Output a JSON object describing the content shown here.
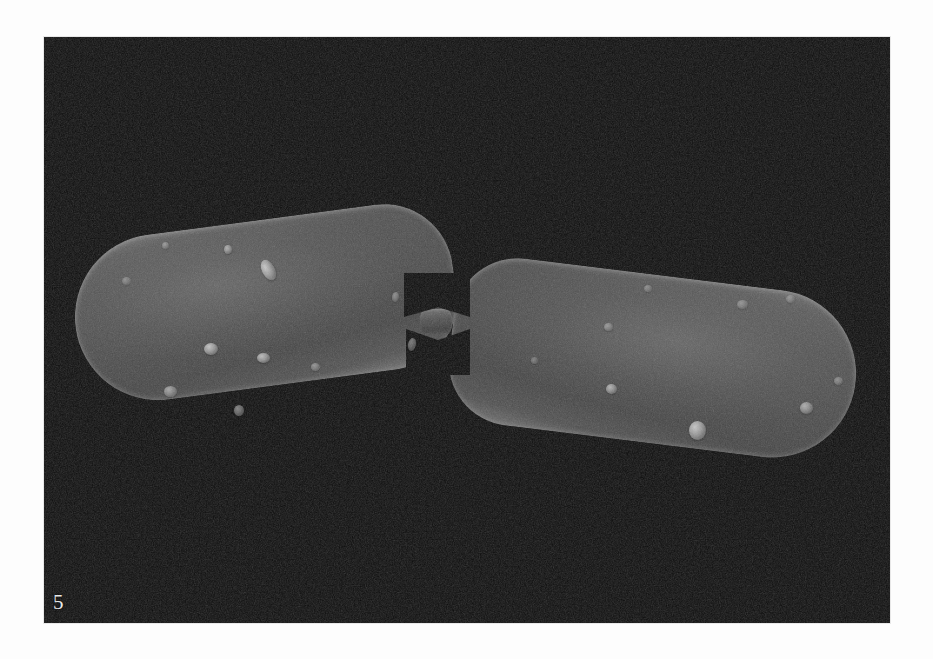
{
  "figure": {
    "plate_number": "5",
    "caption": "Scanning electron micrograph of a rod-shaped bacterium in the final stage of binary fission, the two daughter cells still joined by a narrow constricted septum.",
    "frame": {
      "left": 44,
      "top": 37,
      "width": 846,
      "height": 586
    }
  },
  "colors": {
    "page_background": "#fdfdfd",
    "micrograph_background": "#090909",
    "cell_body": "#4a4a4a",
    "cell_rim_highlight": "#7d7d7d",
    "bleb_highlight": "#cfcfcf",
    "label_text": "#e9e9e9"
  },
  "specimen": {
    "type": "bacillus",
    "state": "dividing",
    "cells": [
      {
        "id": "cell-left",
        "name": "left-daughter-cell",
        "x": 30,
        "y": 183,
        "width": 382,
        "height": 166,
        "rotation_deg": -7.5
      },
      {
        "id": "cell-right",
        "name": "right-daughter-cell",
        "x": 406,
        "y": 238,
        "width": 407,
        "height": 168,
        "rotation_deg": 7.0
      }
    ],
    "septum": {
      "name": "division-septum",
      "x": 376,
      "y": 272,
      "width": 32,
      "height": 26
    },
    "blebs": [
      {
        "x": 218,
        "y": 222,
        "w": 13,
        "h": 22,
        "r": -28,
        "o": 0.95
      },
      {
        "x": 180,
        "y": 208,
        "w": 8,
        "h": 9,
        "r": 0,
        "o": 0.75
      },
      {
        "x": 118,
        "y": 205,
        "w": 7,
        "h": 7,
        "r": 0,
        "o": 0.55
      },
      {
        "x": 78,
        "y": 240,
        "w": 9,
        "h": 8,
        "r": 0,
        "o": 0.45
      },
      {
        "x": 160,
        "y": 306,
        "w": 14,
        "h": 12,
        "r": 0,
        "o": 0.92
      },
      {
        "x": 213,
        "y": 316,
        "w": 13,
        "h": 10,
        "r": 0,
        "o": 0.88
      },
      {
        "x": 267,
        "y": 326,
        "w": 9,
        "h": 8,
        "r": 0,
        "o": 0.55
      },
      {
        "x": 348,
        "y": 255,
        "w": 7,
        "h": 10,
        "r": 10,
        "o": 0.5
      },
      {
        "x": 364,
        "y": 301,
        "w": 8,
        "h": 13,
        "r": 12,
        "o": 0.55
      },
      {
        "x": 120,
        "y": 349,
        "w": 13,
        "h": 11,
        "r": 0,
        "o": 0.7
      },
      {
        "x": 190,
        "y": 368,
        "w": 10,
        "h": 11,
        "r": 0,
        "o": 0.6
      },
      {
        "x": 560,
        "y": 286,
        "w": 9,
        "h": 8,
        "r": 0,
        "o": 0.55
      },
      {
        "x": 600,
        "y": 248,
        "w": 8,
        "h": 7,
        "r": 0,
        "o": 0.45
      },
      {
        "x": 693,
        "y": 263,
        "w": 11,
        "h": 9,
        "r": 0,
        "o": 0.5
      },
      {
        "x": 742,
        "y": 258,
        "w": 9,
        "h": 8,
        "r": 0,
        "o": 0.45
      },
      {
        "x": 562,
        "y": 347,
        "w": 11,
        "h": 10,
        "r": 0,
        "o": 0.8
      },
      {
        "x": 645,
        "y": 384,
        "w": 17,
        "h": 19,
        "r": 0,
        "o": 0.95
      },
      {
        "x": 756,
        "y": 365,
        "w": 13,
        "h": 12,
        "r": 0,
        "o": 0.75
      },
      {
        "x": 790,
        "y": 340,
        "w": 9,
        "h": 8,
        "r": 0,
        "o": 0.5
      },
      {
        "x": 487,
        "y": 320,
        "w": 7,
        "h": 7,
        "r": 0,
        "o": 0.4
      }
    ]
  }
}
